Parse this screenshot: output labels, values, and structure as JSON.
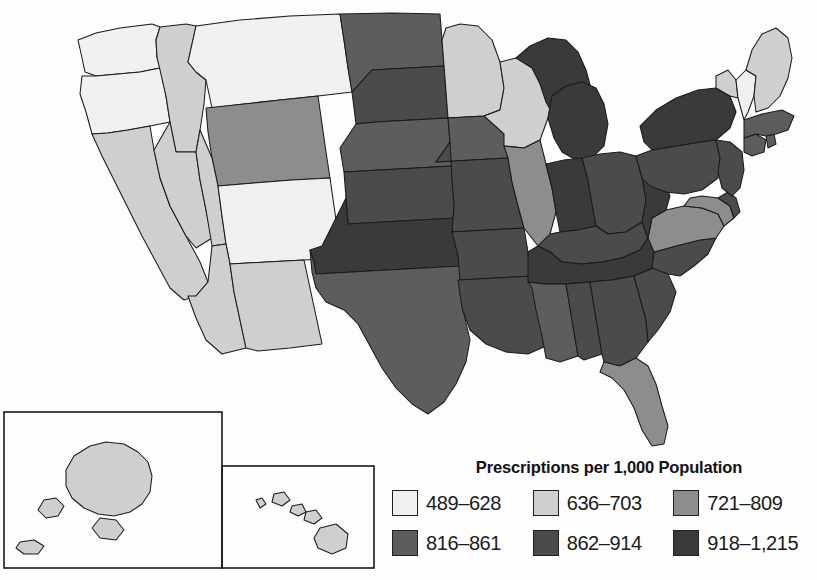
{
  "figure": {
    "type": "choropleth-map",
    "region": "United States",
    "background_color": "#fdfdfd",
    "border_color": "#1a1a1a"
  },
  "legend": {
    "title": "Prescriptions per 1,000 Population",
    "classes": [
      {
        "label": "489–628",
        "color": "#f0f0ee",
        "min": 489,
        "max": 628
      },
      {
        "label": "636–703",
        "color": "#cfcfcd",
        "min": 636,
        "max": 703
      },
      {
        "label": "721–809",
        "color": "#8d8d8c",
        "min": 721,
        "max": 809
      },
      {
        "label": "816–861",
        "color": "#5d5d5d",
        "min": 816,
        "max": 861
      },
      {
        "label": "862–914",
        "color": "#4b4b4b",
        "min": 862,
        "max": 914
      },
      {
        "label": "918–1,215",
        "color": "#3a3a3a",
        "min": 918,
        "max": 1215
      }
    ]
  },
  "insets": [
    {
      "name": "alaska-inset",
      "label": "Alaska"
    },
    {
      "name": "hawaii-inset",
      "label": "Hawaii"
    }
  ],
  "chart_data": {
    "type": "map",
    "title": "Prescriptions per 1,000 Population",
    "categories": [
      "489–628",
      "636–703",
      "721–809",
      "816–861",
      "862–914",
      "918–1,215"
    ],
    "colors": [
      "#f0f0ee",
      "#cfcfcd",
      "#8d8d8c",
      "#5d5d5d",
      "#4b4b4b",
      "#3a3a3a"
    ],
    "value_unit": "prescriptions per 1,000 population",
    "states": [
      {
        "code": "WA",
        "name": "Washington",
        "class": 0
      },
      {
        "code": "OR",
        "name": "Oregon",
        "class": 0
      },
      {
        "code": "CA",
        "name": "California",
        "class": 1
      },
      {
        "code": "ID",
        "name": "Idaho",
        "class": 1
      },
      {
        "code": "NV",
        "name": "Nevada",
        "class": 1
      },
      {
        "code": "MT",
        "name": "Montana",
        "class": 0
      },
      {
        "code": "WY",
        "name": "Wyoming",
        "class": 2
      },
      {
        "code": "UT",
        "name": "Utah",
        "class": 1
      },
      {
        "code": "AZ",
        "name": "Arizona",
        "class": 1
      },
      {
        "code": "CO",
        "name": "Colorado",
        "class": 0
      },
      {
        "code": "NM",
        "name": "New Mexico",
        "class": 1
      },
      {
        "code": "ND",
        "name": "North Dakota",
        "class": 3
      },
      {
        "code": "SD",
        "name": "South Dakota",
        "class": 4
      },
      {
        "code": "NE",
        "name": "Nebraska",
        "class": 3
      },
      {
        "code": "KS",
        "name": "Kansas",
        "class": 4
      },
      {
        "code": "OK",
        "name": "Oklahoma",
        "class": 5
      },
      {
        "code": "TX",
        "name": "Texas",
        "class": 3
      },
      {
        "code": "MN",
        "name": "Minnesota",
        "class": 1
      },
      {
        "code": "IA",
        "name": "Iowa",
        "class": 3
      },
      {
        "code": "MO",
        "name": "Missouri",
        "class": 4
      },
      {
        "code": "AR",
        "name": "Arkansas",
        "class": 4
      },
      {
        "code": "LA",
        "name": "Louisiana",
        "class": 4
      },
      {
        "code": "WI",
        "name": "Wisconsin",
        "class": 1
      },
      {
        "code": "IL",
        "name": "Illinois",
        "class": 2
      },
      {
        "code": "MI",
        "name": "Michigan",
        "class": 5
      },
      {
        "code": "IN",
        "name": "Indiana",
        "class": 5
      },
      {
        "code": "OH",
        "name": "Ohio",
        "class": 4
      },
      {
        "code": "KY",
        "name": "Kentucky",
        "class": 4
      },
      {
        "code": "TN",
        "name": "Tennessee",
        "class": 5
      },
      {
        "code": "MS",
        "name": "Mississippi",
        "class": 3
      },
      {
        "code": "AL",
        "name": "Alabama",
        "class": 4
      },
      {
        "code": "GA",
        "name": "Georgia",
        "class": 4
      },
      {
        "code": "FL",
        "name": "Florida",
        "class": 2
      },
      {
        "code": "SC",
        "name": "South Carolina",
        "class": 4
      },
      {
        "code": "NC",
        "name": "North Carolina",
        "class": 4
      },
      {
        "code": "VA",
        "name": "Virginia",
        "class": 2
      },
      {
        "code": "WV",
        "name": "West Virginia",
        "class": 5
      },
      {
        "code": "MD",
        "name": "Maryland",
        "class": 2
      },
      {
        "code": "DE",
        "name": "Delaware",
        "class": 4
      },
      {
        "code": "PA",
        "name": "Pennsylvania",
        "class": 4
      },
      {
        "code": "NJ",
        "name": "New Jersey",
        "class": 4
      },
      {
        "code": "NY",
        "name": "New York",
        "class": 5
      },
      {
        "code": "CT",
        "name": "Connecticut",
        "class": 3
      },
      {
        "code": "RI",
        "name": "Rhode Island",
        "class": 3
      },
      {
        "code": "MA",
        "name": "Massachusetts",
        "class": 3
      },
      {
        "code": "VT",
        "name": "Vermont",
        "class": 1
      },
      {
        "code": "NH",
        "name": "New Hampshire",
        "class": 0
      },
      {
        "code": "ME",
        "name": "Maine",
        "class": 1
      },
      {
        "code": "AK",
        "name": "Alaska",
        "class": 1
      },
      {
        "code": "HI",
        "name": "Hawaii",
        "class": 1
      }
    ]
  }
}
